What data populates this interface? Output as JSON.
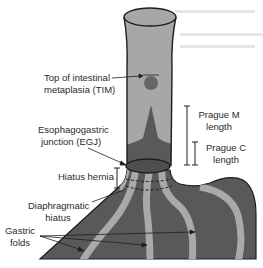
{
  "figure": {
    "colors": {
      "tube_fill": "#a7a7a7",
      "dark_fill": "#595959",
      "fold_fill": "#a9a9a9",
      "outline": "#1e1e1e",
      "text": "#2a2a2a"
    },
    "labels": {
      "tim_line1": "Top of intestinal",
      "tim_line2": "metaplasia (TIM)",
      "egj_line1": "Esophagogastric",
      "egj_line2": "junction (EGJ)",
      "hiatus_hernia": "Hiatus hernia",
      "diaphragmatic_line1": "Diaphragmatic",
      "diaphragmatic_line2": "hiatus",
      "gastric_line1": "Gastric",
      "gastric_line2": "folds",
      "prague_m_line1": "Prague M",
      "prague_m_line2": "length",
      "prague_c_line1": "Prague C",
      "prague_c_line2": "length"
    }
  }
}
